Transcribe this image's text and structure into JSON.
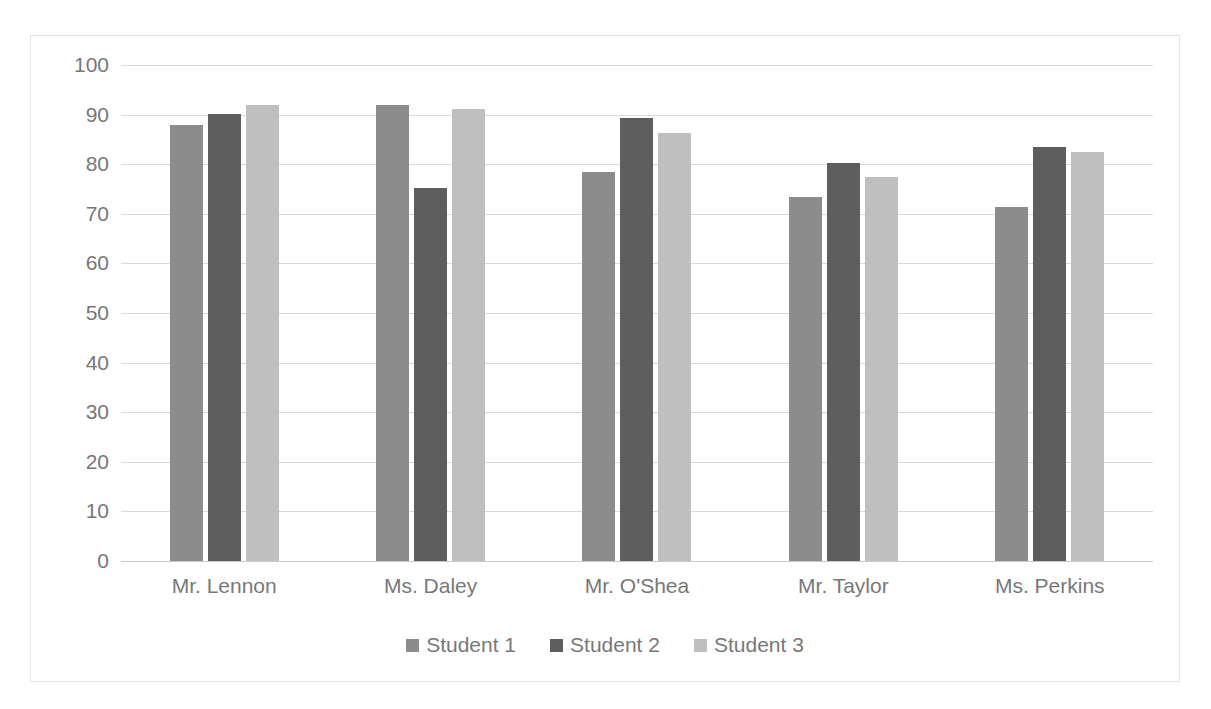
{
  "chart_data": {
    "type": "bar",
    "title": "",
    "subtitle": "",
    "xlabel": "",
    "ylabel": "",
    "ylim": [
      0,
      100
    ],
    "yticks": [
      100,
      90,
      80,
      70,
      60,
      50,
      40,
      30,
      20,
      10,
      0
    ],
    "grid": true,
    "legend_position": "bottom",
    "categories": [
      "Mr. Lennon",
      "Ms. Daley",
      "Mr. O'Shea",
      "Mr. Taylor",
      "Ms. Perkins"
    ],
    "series": [
      {
        "name": "Student 1",
        "color": "#8c8c8c",
        "values": [
          88.0,
          92.0,
          78.4,
          73.3,
          71.4
        ]
      },
      {
        "name": "Student 2",
        "color": "#5e5e5e",
        "values": [
          90.2,
          75.3,
          89.3,
          80.3,
          83.5
        ]
      },
      {
        "name": "Student 3",
        "color": "#bfbfbf",
        "values": [
          92.0,
          91.2,
          86.3,
          77.4,
          82.5
        ]
      }
    ]
  },
  "style": {
    "background": "#ffffff",
    "border_color": "#e3e3e3",
    "gridline_color": "#d9d9d9",
    "text_color": "#787878"
  }
}
